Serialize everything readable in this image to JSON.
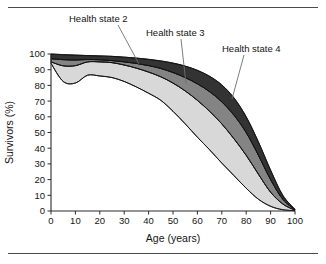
{
  "figure": {
    "title": "",
    "frame_rules": [
      "top-rule",
      "bottom-rule"
    ]
  },
  "axes": {
    "x_title": "Age (years)",
    "y_title": "Survivors (%)",
    "x_ticks": [
      "0",
      "10",
      "20",
      "30",
      "40",
      "50",
      "60",
      "70",
      "80",
      "90",
      "100"
    ],
    "y_ticks": [
      "0",
      "10",
      "20",
      "30",
      "40",
      "50",
      "60",
      "70",
      "80",
      "90",
      "100"
    ]
  },
  "annotations": [
    {
      "id": "health-state-2",
      "label": "Health state 2"
    },
    {
      "id": "health-state-3",
      "label": "Health state 3"
    },
    {
      "id": "health-state-4",
      "label": "Health state 4"
    }
  ],
  "colors": {
    "band_health_state_2": "#d8d8d8",
    "band_health_state_3": "#848484",
    "band_health_state_4": "#333333",
    "outline": "#111111",
    "axis": "#2a2a2a",
    "text": "#141414",
    "leader": "#6e6e6e",
    "background": "#ffffff"
  },
  "chart_data": {
    "type": "area",
    "title": "",
    "xlabel": "Age (years)",
    "ylabel": "Survivors (%)",
    "xlim": [
      0,
      100
    ],
    "ylim": [
      0,
      100
    ],
    "xticks": [
      0,
      10,
      20,
      30,
      40,
      50,
      60,
      70,
      80,
      90,
      100
    ],
    "yticks": [
      0,
      10,
      20,
      30,
      40,
      50,
      60,
      70,
      80,
      90,
      100
    ],
    "grid": false,
    "legend": "inline annotations with leader lines",
    "stacking": "overlaid bands: each band is bounded by an upper and lower survival curve",
    "x": [
      0,
      5,
      10,
      15,
      20,
      25,
      30,
      35,
      40,
      45,
      50,
      55,
      60,
      65,
      70,
      75,
      80,
      85,
      90,
      95,
      100
    ],
    "series": [
      {
        "name": "Health state 4 upper boundary (total survivors)",
        "annotation": "Health state 4",
        "color": "#333333",
        "values": [
          100,
          99.6,
          99.3,
          99.0,
          98.8,
          98.5,
          98.0,
          97.4,
          96.6,
          95.6,
          94.2,
          92.3,
          89.6,
          85.8,
          80.3,
          72.0,
          60.0,
          44.0,
          26.0,
          10.0,
          1.0
        ]
      },
      {
        "name": "Health state 4 lower boundary / Health state 3 upper boundary",
        "annotation": "Health state 3",
        "color": "#848484",
        "values": [
          97.0,
          96.4,
          96.2,
          96.5,
          96.3,
          95.8,
          95.0,
          94.0,
          92.6,
          90.8,
          88.2,
          85.0,
          81.0,
          76.0,
          69.5,
          61.0,
          50.0,
          35.5,
          20.0,
          7.5,
          0.8
        ]
      },
      {
        "name": "Health state 3 lower boundary / Health state 2 upper boundary",
        "annotation": "Health state 2",
        "color": "#d8d8d8",
        "values": [
          95.0,
          92.5,
          92.6,
          95.0,
          95.0,
          94.5,
          93.0,
          91.0,
          88.5,
          85.5,
          81.5,
          76.5,
          70.5,
          63.5,
          55.5,
          46.0,
          35.5,
          23.5,
          12.0,
          4.5,
          0.5
        ]
      },
      {
        "name": "Health state 2 lower boundary (lowest curve)",
        "annotation": "",
        "color": "#ffffff",
        "values": [
          94.0,
          82.5,
          81.5,
          86.5,
          86.0,
          85.0,
          82.5,
          79.0,
          75.0,
          70.5,
          63.5,
          55.5,
          47.0,
          39.0,
          30.5,
          22.5,
          14.5,
          7.5,
          3.0,
          0.8,
          0.2
        ]
      }
    ],
    "bands": [
      {
        "name": "Health state 2",
        "fill": "#d8d8d8",
        "upper_series": 2,
        "lower_series": 3
      },
      {
        "name": "Health state 3",
        "fill": "#848484",
        "upper_series": 1,
        "lower_series": 2
      },
      {
        "name": "Health state 4",
        "fill": "#333333",
        "upper_series": 0,
        "lower_series": 1
      }
    ]
  }
}
